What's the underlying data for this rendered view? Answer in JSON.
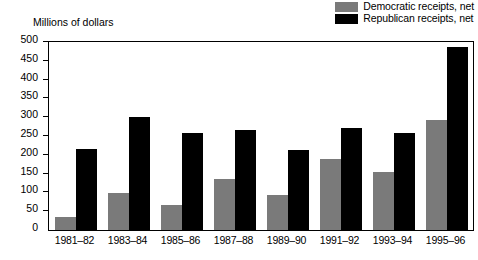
{
  "chart_data": {
    "type": "bar",
    "title": "",
    "subtitle": "",
    "xlabel": "",
    "ylabel": "Millions of dollars",
    "ylim": [
      0,
      500
    ],
    "ytick_step": 50,
    "yticks": [
      0,
      50,
      100,
      150,
      200,
      250,
      300,
      350,
      400,
      450,
      500
    ],
    "ytick_labels": [
      "0",
      "50",
      "100",
      "150",
      "200",
      "250",
      "300",
      "350",
      "400",
      "450",
      "500"
    ],
    "grid": false,
    "legend_position": "top-right",
    "categories": [
      "1981–82",
      "1983–84",
      "1985–86",
      "1987–88",
      "1989–90",
      "1991–92",
      "1993–94",
      "1995–96"
    ],
    "series": [
      {
        "name": "Democratic receipts, net",
        "color": "#7a7a7a",
        "values": [
          35,
          98,
          67,
          135,
          93,
          188,
          153,
          293
        ]
      },
      {
        "name": "Republican receipts, net",
        "color": "#000000",
        "values": [
          215,
          300,
          258,
          265,
          213,
          272,
          258,
          487
        ]
      }
    ],
    "annotations": []
  },
  "legend": {
    "items": [
      {
        "label": "Democratic receipts, net",
        "swatch": "legend-swatch-democratic"
      },
      {
        "label": "Republican receipts, net",
        "swatch": "legend-swatch-republican"
      }
    ]
  },
  "axis": {
    "y_title": "Millions of dollars"
  }
}
